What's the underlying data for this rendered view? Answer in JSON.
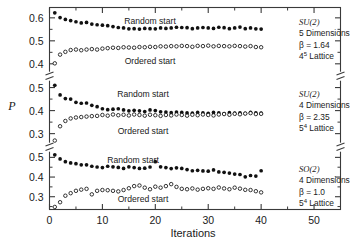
{
  "chart_data": {
    "type": "scatter",
    "title": "",
    "xlabel": "Iterations",
    "ylabel": "P",
    "xlim": [
      0,
      55
    ],
    "xticks": [
      0,
      10,
      20,
      30,
      40,
      50
    ],
    "xticklabels": [
      "0",
      "10",
      "20",
      "30",
      "40",
      "50"
    ],
    "grid": false,
    "legend_position": "inline-annotations",
    "broken_axis": true,
    "panels": [
      {
        "name": "panel-top",
        "ylim": [
          0.36,
          0.645
        ],
        "yticks": [
          0.4,
          0.5,
          0.6
        ],
        "yticklabels": [
          "0.4",
          "0.5",
          "0.6"
        ],
        "annotation": {
          "group": "SU(2)",
          "dimensions": "5 Dimensions",
          "beta": "β  =  1.64",
          "lattice_base": "4",
          "lattice_exp": "5",
          "lattice_suffix": " Lattice"
        },
        "series": [
          {
            "name": "Random start",
            "marker": "filled-circle",
            "label": "Random start",
            "x": [
              1,
              2,
              3,
              4,
              5,
              6,
              7,
              8,
              9,
              10,
              11,
              12,
              13,
              14,
              15,
              16,
              17,
              18,
              19,
              20,
              21,
              22,
              23,
              24,
              25,
              26,
              27,
              28,
              29,
              30,
              31,
              32,
              33,
              34,
              35,
              36,
              37,
              38,
              39,
              40
            ],
            "y": [
              0.622,
              0.601,
              0.593,
              0.588,
              0.583,
              0.578,
              0.58,
              0.573,
              0.57,
              0.568,
              0.566,
              0.562,
              0.558,
              0.556,
              0.552,
              0.553,
              0.551,
              0.554,
              0.553,
              0.552,
              0.556,
              0.554,
              0.556,
              0.559,
              0.558,
              0.557,
              0.553,
              0.556,
              0.558,
              0.556,
              0.554,
              0.559,
              0.557,
              0.553,
              0.556,
              0.56,
              0.553,
              0.556,
              0.552,
              0.551
            ]
          },
          {
            "name": "Ordered start",
            "marker": "open-circle",
            "label": "Ordered start",
            "x": [
              1,
              2,
              3,
              4,
              5,
              6,
              7,
              8,
              9,
              10,
              11,
              12,
              13,
              14,
              15,
              16,
              17,
              18,
              19,
              20,
              21,
              22,
              23,
              24,
              25,
              26,
              27,
              28,
              29,
              30,
              31,
              32,
              33,
              34,
              35,
              36,
              37,
              38,
              39,
              40
            ],
            "y": [
              0.402,
              0.44,
              0.452,
              0.46,
              0.462,
              0.459,
              0.462,
              0.464,
              0.462,
              0.466,
              0.468,
              0.47,
              0.469,
              0.472,
              0.471,
              0.47,
              0.473,
              0.472,
              0.474,
              0.473,
              0.476,
              0.475,
              0.477,
              0.476,
              0.478,
              0.477,
              0.474,
              0.478,
              0.477,
              0.479,
              0.476,
              0.478,
              0.477,
              0.476,
              0.478,
              0.477,
              0.475,
              0.477,
              0.473,
              0.472
            ]
          }
        ]
      },
      {
        "name": "panel-middle",
        "ylim": [
          0.255,
          0.535
        ],
        "yticks": [
          0.3,
          0.4,
          0.5
        ],
        "yticklabels": [
          "0.3",
          "0.4",
          "0.5"
        ],
        "annotation": {
          "group": "SU(2)",
          "dimensions": "4 Dimensions",
          "beta": "β  =  2.35",
          "lattice_base": "5",
          "lattice_exp": "4",
          "lattice_suffix": " Lattice"
        },
        "series": [
          {
            "name": "Random start",
            "marker": "filled-circle",
            "label": "Random start",
            "x": [
              1,
              2,
              3,
              4,
              5,
              6,
              7,
              8,
              9,
              10,
              11,
              12,
              13,
              14,
              15,
              16,
              17,
              18,
              19,
              20,
              21,
              22,
              23,
              24,
              25,
              26,
              27,
              28,
              29,
              30,
              31,
              32,
              33,
              34,
              35,
              36,
              37,
              38,
              39,
              40
            ],
            "y": [
              0.51,
              0.468,
              0.452,
              0.45,
              0.436,
              0.432,
              0.433,
              0.423,
              0.417,
              0.408,
              0.404,
              0.406,
              0.408,
              0.403,
              0.399,
              0.401,
              0.399,
              0.396,
              0.403,
              0.4,
              0.395,
              0.394,
              0.391,
              0.394,
              0.392,
              0.39,
              0.389,
              0.392,
              0.39,
              0.388,
              0.392,
              0.39,
              0.387,
              0.391,
              0.389,
              0.39,
              0.388,
              0.392,
              0.39,
              0.389
            ]
          },
          {
            "name": "Ordered start",
            "marker": "open-circle",
            "label": "Ordered start",
            "x": [
              1,
              2,
              3,
              4,
              5,
              6,
              7,
              8,
              9,
              10,
              11,
              12,
              13,
              14,
              15,
              16,
              17,
              18,
              19,
              20,
              21,
              22,
              23,
              24,
              25,
              26,
              27,
              28,
              29,
              30,
              31,
              32,
              33,
              34,
              35,
              36,
              37,
              38,
              39,
              40
            ],
            "y": [
              0.27,
              0.332,
              0.355,
              0.366,
              0.37,
              0.372,
              0.374,
              0.376,
              0.377,
              0.381,
              0.378,
              0.383,
              0.38,
              0.382,
              0.379,
              0.383,
              0.381,
              0.378,
              0.382,
              0.38,
              0.377,
              0.381,
              0.379,
              0.383,
              0.381,
              0.378,
              0.382,
              0.38,
              0.383,
              0.381,
              0.379,
              0.383,
              0.385,
              0.382,
              0.386,
              0.384,
              0.387,
              0.389,
              0.385,
              0.386
            ]
          }
        ]
      },
      {
        "name": "panel-bottom",
        "ylim": [
          0.235,
          0.535
        ],
        "yticks": [
          0.3,
          0.4,
          0.5
        ],
        "yticklabels": [
          "0.3",
          "0.4",
          "0.5"
        ],
        "annotation": {
          "group": "SO(2)",
          "dimensions": "4 Dimensions",
          "beta": "β  =  1.0",
          "lattice_base": "5",
          "lattice_exp": "4",
          "lattice_suffix": " Lattice"
        },
        "series": [
          {
            "name": "Random start",
            "marker": "filled-circle",
            "label": "Random start",
            "x": [
              1,
              2,
              3,
              4,
              5,
              6,
              7,
              8,
              9,
              10,
              11,
              12,
              13,
              14,
              15,
              16,
              17,
              18,
              19,
              20,
              21,
              22,
              23,
              24,
              25,
              26,
              27,
              28,
              29,
              30,
              31,
              32,
              33,
              34,
              35,
              36,
              37,
              38,
              39,
              40
            ],
            "y": [
              0.513,
              0.492,
              0.478,
              0.472,
              0.468,
              0.462,
              0.462,
              0.455,
              0.451,
              0.448,
              0.455,
              0.452,
              0.449,
              0.444,
              0.452,
              0.448,
              0.444,
              0.445,
              0.451,
              0.478,
              0.452,
              0.448,
              0.443,
              0.447,
              0.444,
              0.438,
              0.432,
              0.434,
              0.431,
              0.43,
              0.436,
              0.426,
              0.424,
              0.42,
              0.415,
              0.413,
              0.401,
              0.408,
              0.405,
              0.432
            ]
          },
          {
            "name": "Ordered start",
            "marker": "open-circle",
            "label": "Ordered start",
            "x": [
              1,
              2,
              3,
              4,
              5,
              6,
              7,
              8,
              9,
              10,
              11,
              12,
              13,
              14,
              15,
              16,
              17,
              18,
              19,
              20,
              21,
              22,
              23,
              24,
              25,
              26,
              27,
              28,
              29,
              30,
              31,
              32,
              33,
              34,
              35,
              36,
              37,
              38,
              39,
              40
            ],
            "y": [
              0.248,
              0.272,
              0.305,
              0.318,
              0.33,
              0.336,
              0.34,
              0.312,
              0.33,
              0.334,
              0.333,
              0.33,
              0.327,
              0.334,
              0.343,
              0.354,
              0.357,
              0.346,
              0.338,
              0.351,
              0.346,
              0.354,
              0.364,
              0.35,
              0.34,
              0.338,
              0.342,
              0.336,
              0.34,
              0.343,
              0.34,
              0.347,
              0.342,
              0.338,
              0.346,
              0.341,
              0.335,
              0.334,
              0.328,
              0.322
            ]
          }
        ]
      }
    ]
  }
}
